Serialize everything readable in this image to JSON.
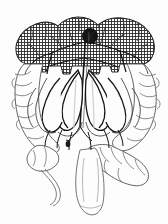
{
  "figure": {
    "kind": "anatomical-illustration",
    "style": "black-and-white line drawing with cross-hatched shading",
    "width_px": 168,
    "height_px": 224,
    "background_color": "#fdfdfd",
    "line_color": "#1a1a1a",
    "light_line_color": "#7d7d7d",
    "hatch_color": "#2b2b2b",
    "marker_color": "#141414",
    "title": "",
    "caption": "",
    "labels": [],
    "visible_text": []
  },
  "structures": {
    "transverse_colon": {
      "name": "transverse colon",
      "shaded": true,
      "shading_pattern": "cross-hatch"
    },
    "ascending_colon": {
      "name": "ascending colon",
      "side": "left-of-image",
      "shaded": false
    },
    "descending_colon": {
      "name": "descending colon",
      "side": "right-of-image",
      "shaded": false
    },
    "cecum": {
      "name": "cecum",
      "shaded": false
    },
    "appendix": {
      "name": "appendix",
      "shaded": false
    },
    "sigmoid_colon": {
      "name": "sigmoid colon",
      "shaded": false
    },
    "rectum": {
      "name": "rectum",
      "shaded": false
    },
    "mesenteric_vessels": {
      "name": "mesenteric arterial arcades",
      "shaded": false
    },
    "lesion_marker": {
      "name": "lesion marker",
      "shape": "filled-circle",
      "center_x": 90,
      "center_y": 36,
      "radius": 7,
      "color": "#141414"
    },
    "secondary_marker": {
      "name": "secondary marker",
      "shape": "small-filled-blob",
      "center_x": 68,
      "center_y": 144,
      "radius": 2,
      "color": "#1a1a1a"
    }
  }
}
